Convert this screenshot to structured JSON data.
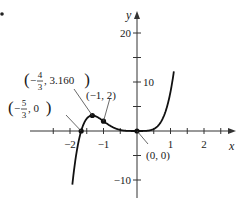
{
  "chart_data": {
    "type": "line",
    "title": "",
    "function": "f(x) = 3x^5 + 5x^4",
    "xlabel": "x",
    "ylabel": "y",
    "xlim": [
      -2.2,
      3.0
    ],
    "ylim": [
      -14,
      24
    ],
    "x_ticks": [
      -2,
      -1,
      1,
      2
    ],
    "x_tick_labels": [
      "−2",
      "−1",
      "1",
      "2"
    ],
    "y_ticks": [
      -10,
      -5,
      5,
      10,
      15,
      20
    ],
    "y_tick_labels": {
      "20": "20",
      "10": "10",
      "-10": "−10"
    },
    "grid": false,
    "points": [
      {
        "x": -1.6667,
        "y": 0,
        "label": "(−5/3, 0)"
      },
      {
        "x": -1.3333,
        "y": 3.16,
        "label": "(−4/3, 3.160)"
      },
      {
        "x": -1,
        "y": 2,
        "label": "(−1, 2)"
      },
      {
        "x": 0,
        "y": 0,
        "label": "(0, 0)"
      }
    ],
    "annotations": [
      {
        "text_parts": [
          "(−",
          "5",
          "3",
          ", 0)"
        ],
        "target": [
          -1.6667,
          0
        ]
      },
      {
        "text_parts": [
          "(−",
          "4",
          "3",
          ", 3.160)"
        ],
        "target": [
          -1.3333,
          3.16
        ]
      },
      {
        "text": "(−1, 2)",
        "target": [
          -1,
          2
        ]
      },
      {
        "text": "(0, 0)",
        "target": [
          0,
          0
        ]
      }
    ]
  },
  "colors": {
    "curve": "#111111",
    "axis": "#333333",
    "text": "#1a1a1a",
    "background": "#ffffff"
  }
}
